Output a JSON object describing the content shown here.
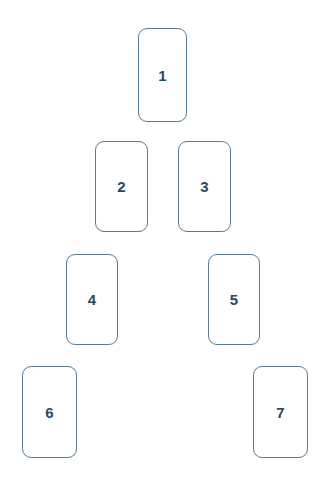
{
  "diagram": {
    "background_color": "#ffffff",
    "card_border_color": "#5a7d94",
    "card_fill_color": "#ffffff",
    "number_color": "#2c4a5e",
    "canvas": {
      "width": 325,
      "height": 487
    },
    "card_count": 7,
    "rows": [
      {
        "row_index": 1,
        "card_labels": [
          "1"
        ]
      },
      {
        "row_index": 2,
        "card_labels": [
          "2",
          "3"
        ]
      },
      {
        "row_index": 3,
        "card_labels": [
          "4",
          "5"
        ]
      },
      {
        "row_index": 4,
        "card_labels": [
          "6",
          "7"
        ]
      }
    ],
    "cards": [
      {
        "label": "1",
        "x": 138,
        "y": 28,
        "width": 49,
        "height": 94,
        "row": 1
      },
      {
        "label": "2",
        "x": 95,
        "y": 141,
        "width": 53,
        "height": 91,
        "row": 2
      },
      {
        "label": "3",
        "x": 178,
        "y": 141,
        "width": 53,
        "height": 91,
        "row": 2
      },
      {
        "label": "4",
        "x": 66,
        "y": 254,
        "width": 52,
        "height": 91,
        "row": 3
      },
      {
        "label": "5",
        "x": 208,
        "y": 254,
        "width": 52,
        "height": 91,
        "row": 3
      },
      {
        "label": "6",
        "x": 22,
        "y": 366,
        "width": 55,
        "height": 92,
        "row": 4
      },
      {
        "label": "7",
        "x": 253,
        "y": 366,
        "width": 55,
        "height": 92,
        "row": 4
      }
    ]
  }
}
